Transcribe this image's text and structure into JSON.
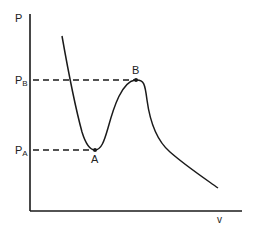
{
  "diagram": {
    "type": "pressure-volume isotherm (van der Waals loop)",
    "axes": {
      "y_label": "P",
      "x_label": "v"
    },
    "levels": [
      {
        "label_main": "P",
        "label_sub": "B",
        "point": "B"
      },
      {
        "label_main": "P",
        "label_sub": "A",
        "point": "A"
      }
    ],
    "points": {
      "A": "A",
      "B": "B"
    },
    "colors": {
      "line": "#1a1a1a",
      "background": "#ffffff"
    }
  }
}
